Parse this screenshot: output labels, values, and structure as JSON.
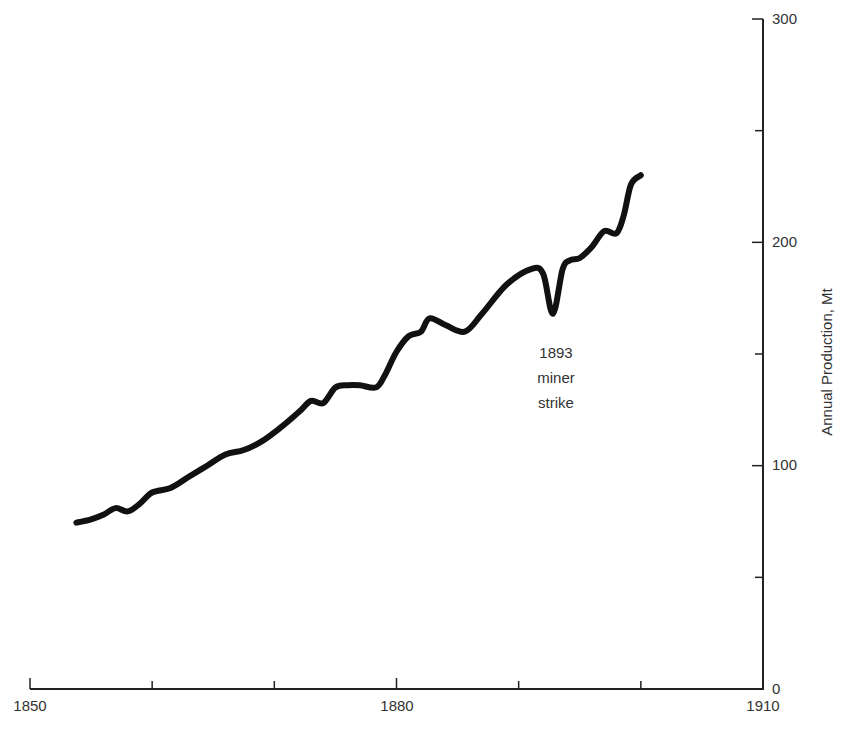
{
  "chart_data": {
    "type": "line",
    "title": "",
    "xlabel": "",
    "ylabel": "Annual Production, Mt",
    "xlim": [
      1850,
      1910
    ],
    "ylim": [
      0,
      300
    ],
    "x_ticks": [
      1850,
      1860,
      1870,
      1880,
      1890,
      1900,
      1910
    ],
    "x_tick_labels": [
      "1850",
      "",
      "",
      "1880",
      "",
      "",
      "1910"
    ],
    "y_ticks": [
      0,
      50,
      100,
      150,
      200,
      250,
      300
    ],
    "y_tick_labels": [
      "0",
      "",
      "100",
      "",
      "200",
      "",
      "300"
    ],
    "y_axis_position": "right",
    "grid": false,
    "legend": null,
    "series": [
      {
        "name": "Annual Production",
        "color": "#111111",
        "x": [
          1853.8,
          1855,
          1856,
          1857,
          1858,
          1859,
          1860,
          1861.5,
          1863,
          1864.5,
          1866,
          1867.5,
          1869,
          1870.5,
          1872,
          1873,
          1874,
          1875,
          1876,
          1877,
          1878.3,
          1879,
          1880,
          1881,
          1882,
          1882.7,
          1884,
          1885.6,
          1887,
          1889,
          1891,
          1892,
          1892.8,
          1893.6,
          1894.2,
          1895,
          1896,
          1897,
          1898,
          1898.6,
          1899.2,
          1900
        ],
        "y": [
          74.5,
          76,
          78,
          81,
          79.5,
          83,
          88,
          90,
          95,
          100,
          105,
          107,
          111,
          117,
          124,
          129,
          128,
          135,
          136,
          136,
          135,
          140,
          151,
          158,
          160,
          166,
          163,
          160,
          168,
          181,
          188,
          186,
          168,
          188,
          192,
          193,
          198,
          205,
          204,
          212,
          226,
          230
        ]
      }
    ],
    "annotations": [
      {
        "text_lines": [
          "1893",
          "miner",
          "strike"
        ],
        "x": 1893,
        "y": 150
      }
    ]
  },
  "labels": {
    "x_tick_1850": "1850",
    "x_tick_1880": "1880",
    "x_tick_1910": "1910",
    "y_tick_0": "0",
    "y_tick_100": "100",
    "y_tick_200": "200",
    "y_tick_300": "300",
    "ylabel": "Annual Production, Mt",
    "annotation_line1": "1893",
    "annotation_line2": "miner",
    "annotation_line3": "strike"
  }
}
